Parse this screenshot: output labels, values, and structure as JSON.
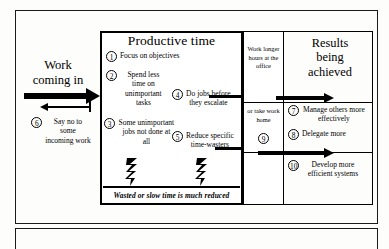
{
  "diagram": {
    "left_label": "Work\ncoming in",
    "left_label_line1": "Work",
    "left_label_line2": "coming in",
    "productive_box_title": "Productive time",
    "wasted_band_text": "Wasted or slow time is much reduced",
    "results_title_line1": "Results",
    "results_title_line2": "being",
    "results_title_line3": "achieved"
  },
  "productive_items": [
    {
      "num": "1",
      "text": "Focus on objectives"
    },
    {
      "num": "2",
      "text": "Spend less time on unimportant tasks"
    },
    {
      "num": "3",
      "text": "Some unimportant jobs not done at all"
    },
    {
      "num": "4",
      "text": "Do jobs before they escalate"
    },
    {
      "num": "5",
      "text": "Reduce specific time-wasters"
    }
  ],
  "left_items": [
    {
      "num": "6",
      "text": "Say no to some incoming work"
    }
  ],
  "middle_column": [
    {
      "num": "",
      "text": "Work longer hours at the office"
    },
    {
      "num": "",
      "text": "or take work home"
    },
    {
      "num": "9",
      "text": ""
    }
  ],
  "results_items": [
    {
      "num": "7",
      "text": "Manage others more effectively"
    },
    {
      "num": "8",
      "text": "Delegate more"
    },
    {
      "num": "10",
      "text": "Develop more efficient systems"
    }
  ],
  "colors": {
    "ink": "#000000",
    "frame": "#1a1a1a",
    "paper": "#fdfdfc"
  }
}
